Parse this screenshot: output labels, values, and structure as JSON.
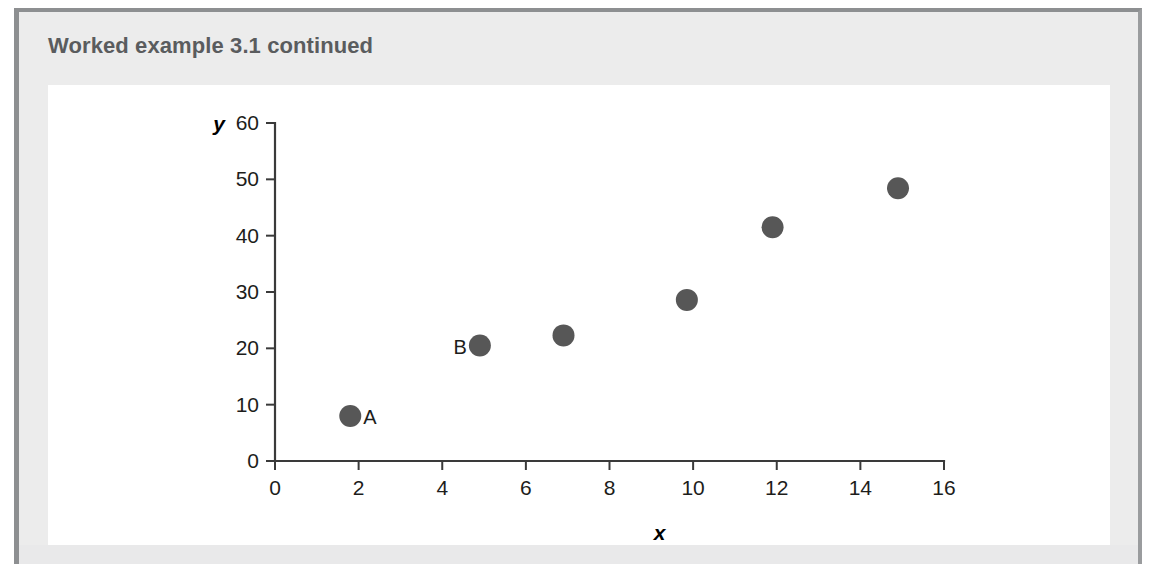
{
  "heading": {
    "text": "Worked example 3.1 continued"
  },
  "colors": {
    "frame_border": "#8d8f91",
    "panel_background": "#ececec",
    "card_background": "#ffffff",
    "heading_text": "#5a5c5e",
    "marker": "#575757",
    "axis": "#3a3a3a",
    "tick_text": "#1d1d1b"
  },
  "chart_data": {
    "type": "scatter",
    "title": "",
    "xlabel": "x",
    "ylabel": "y",
    "xlim": [
      0,
      16
    ],
    "ylim": [
      0,
      60
    ],
    "xticks": [
      0,
      2,
      4,
      6,
      8,
      10,
      12,
      14,
      16
    ],
    "yticks": [
      0,
      10,
      20,
      30,
      40,
      50,
      60
    ],
    "grid": false,
    "legend": "none",
    "series": [
      {
        "name": "data",
        "marker": "filled-circle",
        "color": "#575757",
        "points": [
          {
            "x": 1.8,
            "y": 8.0,
            "label": "A",
            "label_side": "right"
          },
          {
            "x": 4.9,
            "y": 20.5,
            "label": "B",
            "label_side": "left"
          },
          {
            "x": 6.9,
            "y": 22.3,
            "label": "",
            "label_side": "right"
          },
          {
            "x": 9.85,
            "y": 28.6,
            "label": "",
            "label_side": "right"
          },
          {
            "x": 11.9,
            "y": 41.5,
            "label": "",
            "label_side": "right"
          },
          {
            "x": 14.9,
            "y": 48.4,
            "label": "",
            "label_side": "right"
          }
        ]
      }
    ]
  }
}
